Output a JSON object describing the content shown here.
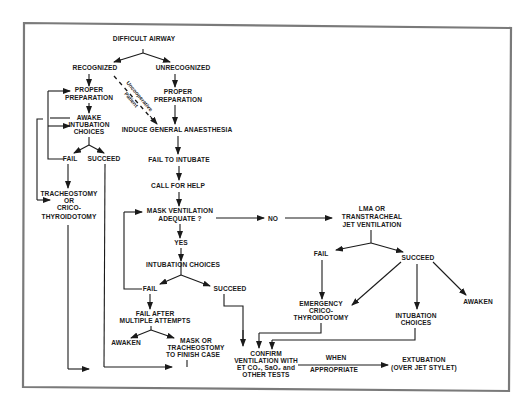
{
  "diagram": {
    "title": "DIFFICULT AIRWAY",
    "frame_color": "#7a7a7a",
    "ink_color": "#1a1a1a",
    "nodes": {
      "difficult_airway": "DIFFICULT AIRWAY",
      "recognized": "RECOGNIZED",
      "unrecognized": "UNRECOGNIZED",
      "proper_prep_left_1": "PROPER",
      "proper_prep_left_2": "PREPARATION",
      "proper_prep_right_1": "PROPER",
      "proper_prep_right_2": "PREPARATION",
      "uncooperative_1": "Uncooperative",
      "uncooperative_2": "Patient",
      "awake_1": "AWAKE",
      "awake_2": "INTUBATION",
      "awake_3": "CHOICES",
      "induce_ga": "INDUCE GENERAL ANAESTHESIA",
      "fail_left": "FAIL",
      "succeed_left": "SUCCEED",
      "trach_1": "TRACHEOSTOMY",
      "trach_2": "OR",
      "trach_3": "CRICO-",
      "trach_4": "THYROIDOTOMY",
      "fail_to_intubate": "FAIL TO INTUBATE",
      "call_for_help": "CALL FOR HELP",
      "mask_vent_1": "MASK VENTILATION",
      "mask_vent_2": "ADEQUATE  ?",
      "no": "NO",
      "yes": "YES",
      "lma_1": "LMA OR",
      "lma_2": "TRANSTRACHEAL",
      "lma_3": "JET VENTILATION",
      "fail_lma": "FAIL",
      "succeed_lma": "SUCCEED",
      "intubation_choices_mid": "INTUBATION  CHOICES",
      "fail_mid": "FAIL",
      "succeed_mid": "SUCCEED",
      "fail_after_1": "FAIL AFTER",
      "fail_after_2": "MULTIPLE ATTEMPTS",
      "awaken_left": "AWAKEN",
      "mask_trach_1": "MASK OR",
      "mask_trach_2": "TRACHEOSTOMY",
      "mask_trach_3": "TO FINISH CASE",
      "emerg_1": "EMERGENCY",
      "emerg_2": "CRICO-",
      "emerg_3": "THYROIDOTOMY",
      "intub_choices_right_1": "INTUBATION",
      "intub_choices_right_2": "CHOICES",
      "awaken_right": "AWAKEN",
      "confirm_1": "CONFIRM",
      "confirm_2": "VENTILATION WITH",
      "confirm_3": "ET CO₂, SaO₂  and",
      "confirm_4": "OTHER TESTS",
      "when": "WHEN",
      "appropriate": "APPROPRIATE",
      "extubation_1": "EXTUBATION",
      "extubation_2": "(OVER JET STYLET)"
    }
  }
}
